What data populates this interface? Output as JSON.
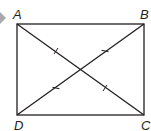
{
  "figure": {
    "type": "rectangle-with-diagonals",
    "vertices": {
      "A": {
        "label": "A",
        "x": 17,
        "y": 24
      },
      "B": {
        "label": "B",
        "x": 144,
        "y": 24
      },
      "C": {
        "label": "C",
        "x": 144,
        "y": 115
      },
      "D": {
        "label": "D",
        "x": 17,
        "y": 115
      }
    },
    "diagonals": [
      "AC",
      "BD"
    ],
    "congruence_marks": "single tick on each half-diagonal",
    "colors": {
      "stroke": "#231f20",
      "marker": "#a7a9ac"
    }
  }
}
